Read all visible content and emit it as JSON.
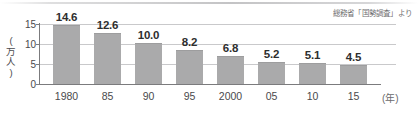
{
  "source_note": "総務省「国勢調査」より",
  "chart_data": {
    "type": "bar",
    "title": "",
    "xlabel": "(年)",
    "ylabel": "(万人)",
    "ylabel_chars": [
      "(",
      "万",
      "人",
      ")"
    ],
    "categories": [
      "1980",
      "85",
      "90",
      "95",
      "2000",
      "05",
      "10",
      "15"
    ],
    "values": [
      14.6,
      12.6,
      10.0,
      8.2,
      6.8,
      5.2,
      5.1,
      4.5
    ],
    "value_labels": [
      "14.6",
      "12.6",
      "10.0",
      "8.2",
      "6.8",
      "5.2",
      "5.1",
      "4.5"
    ],
    "yticks": [
      0,
      5,
      10,
      15
    ],
    "ytick_labels": [
      "0",
      "5",
      "10",
      "15"
    ],
    "ylim": [
      0,
      15
    ],
    "grid": true,
    "legend": null,
    "bar_color": "#aaaaab",
    "axis_color": "#7b7b7d",
    "grid_color": "#c9c9cb"
  }
}
